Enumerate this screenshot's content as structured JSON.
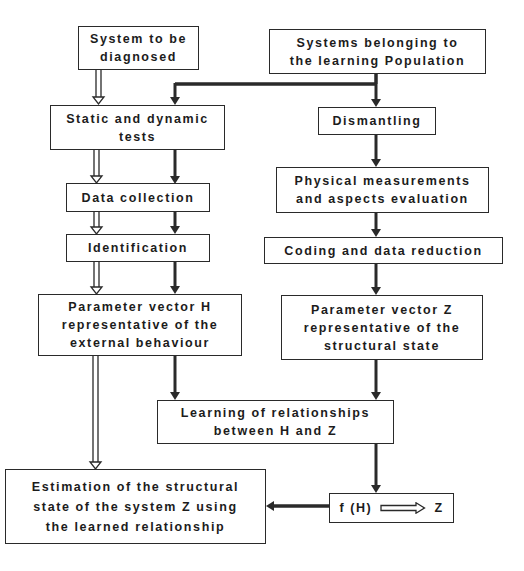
{
  "diagram": {
    "type": "flowchart",
    "colors": {
      "line": "#2a2a2a",
      "background": "#ffffff"
    },
    "nodes": {
      "system_to_diagnose": "System to be\ndiagnosed",
      "learning_population": "Systems belonging to\nthe learning Population",
      "static_dynamic_tests": "Static and dynamic\ntests",
      "dismantling": "Dismantling",
      "physical_measurements": "Physical measurements\nand aspects evaluation",
      "data_collection": "Data collection",
      "identification": "Identification",
      "coding_data_reduction": "Coding and data reduction",
      "parameter_vector_h": "Parameter vector H\nrepresentative of the\nexternal behaviour",
      "parameter_vector_z": "Parameter vector Z\nrepresentative of the\nstructural state",
      "learning_relationships": "Learning of relationships\nbetween H and Z",
      "estimation": "Estimation of the structural\nstate of the system Z using\nthe learned relationship",
      "function_left": "f (H)",
      "function_right": "Z"
    },
    "edges": [
      {
        "from": "system_to_diagnose",
        "to": "static_dynamic_tests",
        "style": "hollow"
      },
      {
        "from": "learning_population",
        "to": "static_dynamic_tests",
        "style": "solid"
      },
      {
        "from": "learning_population",
        "to": "dismantling",
        "style": "solid"
      },
      {
        "from": "dismantling",
        "to": "physical_measurements",
        "style": "solid"
      },
      {
        "from": "physical_measurements",
        "to": "coding_data_reduction",
        "style": "solid"
      },
      {
        "from": "coding_data_reduction",
        "to": "parameter_vector_z",
        "style": "solid"
      },
      {
        "from": "static_dynamic_tests",
        "to": "data_collection",
        "style": "hollow+solid"
      },
      {
        "from": "data_collection",
        "to": "identification",
        "style": "hollow+solid"
      },
      {
        "from": "identification",
        "to": "parameter_vector_h",
        "style": "hollow+solid"
      },
      {
        "from": "parameter_vector_h",
        "to": "learning_relationships",
        "style": "solid"
      },
      {
        "from": "parameter_vector_z",
        "to": "learning_relationships",
        "style": "solid"
      },
      {
        "from": "parameter_vector_h",
        "to": "estimation",
        "style": "hollow"
      },
      {
        "from": "learning_relationships",
        "to": "function",
        "style": "solid"
      },
      {
        "from": "function",
        "to": "estimation",
        "style": "solid"
      }
    ]
  }
}
